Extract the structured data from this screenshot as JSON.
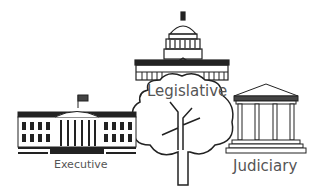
{
  "diagram": {
    "branches": [
      {
        "id": "executive",
        "label": "Executive",
        "icon": "white-house-icon"
      },
      {
        "id": "legislative",
        "label": "Legislative",
        "icon": "capitol-building-icon"
      },
      {
        "id": "judiciary",
        "label": "Judiciary",
        "icon": "supreme-court-icon"
      }
    ],
    "center_icon": "tree-icon",
    "colors": {
      "line": "#222222",
      "text": "#555555",
      "background": "#ffffff"
    }
  }
}
